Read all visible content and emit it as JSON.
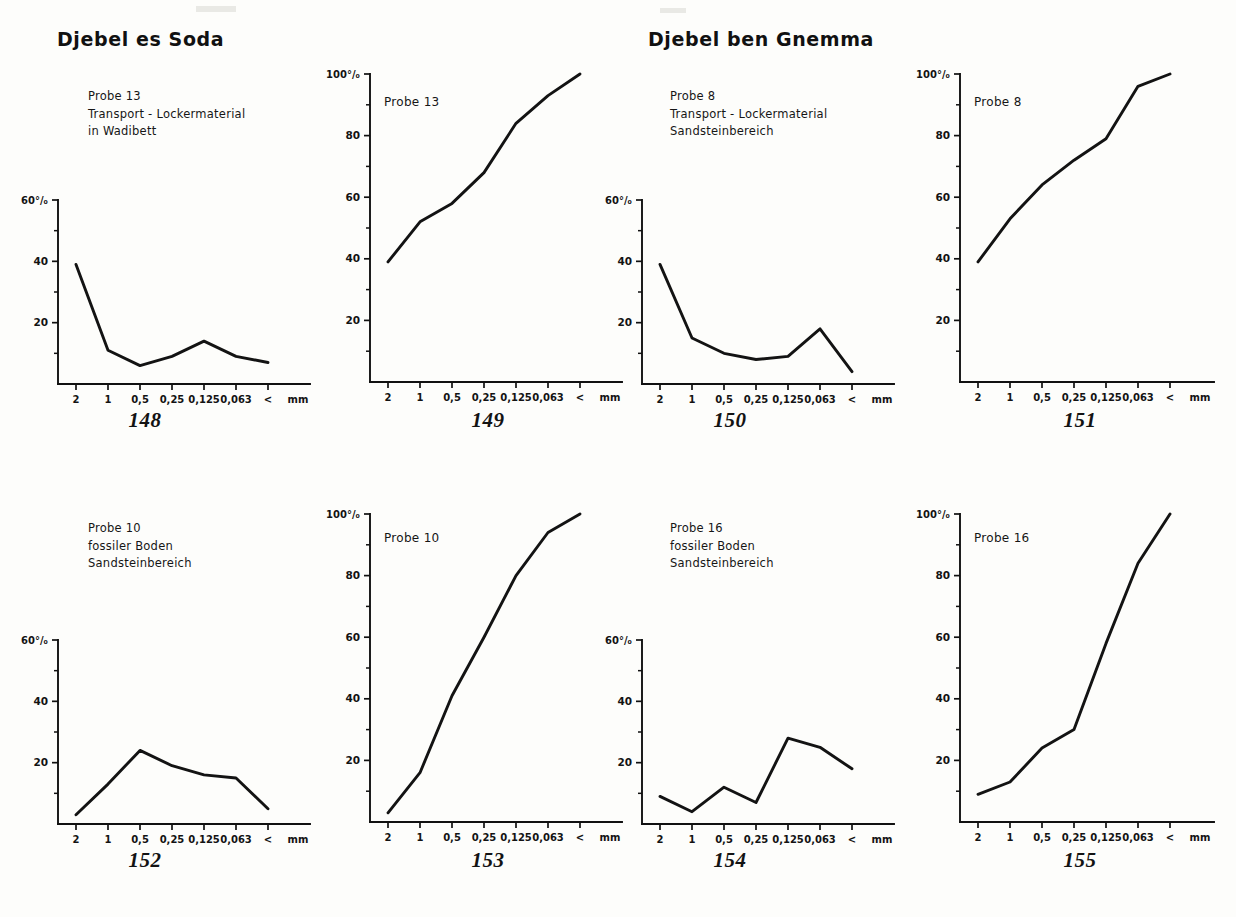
{
  "locations": [
    {
      "name": "Djebel es Soda"
    },
    {
      "name": "Djebel ben Gnemma"
    }
  ],
  "axis": {
    "x_categories": [
      "2",
      "1",
      "0,5",
      "0,25",
      "0,125",
      "0,063",
      "<"
    ],
    "x_unit": "mm",
    "y_small_labels": [
      "60%",
      "40",
      "20"
    ],
    "y_large_labels": [
      "100%",
      "80",
      "60",
      "40",
      "20"
    ],
    "y_small_top_text": "60°/₀",
    "y_large_top_text": "100°/₀"
  },
  "charts": [
    {
      "figure": "148",
      "probe": "Probe 13",
      "desc_line2": "Transport - Lockermaterial",
      "desc_line3": "in Wadibett",
      "kind": "histogram"
    },
    {
      "figure": "149",
      "probe": "Probe 13",
      "kind": "cumulative"
    },
    {
      "figure": "150",
      "probe": "Probe 8",
      "desc_line2": "Transport - Lockermaterial",
      "desc_line3": "Sandsteinbereich",
      "kind": "histogram"
    },
    {
      "figure": "151",
      "probe": "Probe 8",
      "kind": "cumulative"
    },
    {
      "figure": "152",
      "probe": "Probe 10",
      "desc_line2": "fossiler Boden",
      "desc_line3": "Sandsteinbereich",
      "kind": "histogram"
    },
    {
      "figure": "153",
      "probe": "Probe 10",
      "kind": "cumulative"
    },
    {
      "figure": "154",
      "probe": "Probe 16",
      "desc_line2": "fossiler Boden",
      "desc_line3": "Sandsteinbereich",
      "kind": "histogram"
    },
    {
      "figure": "155",
      "probe": "Probe 16",
      "kind": "cumulative"
    }
  ],
  "chart_data": [
    {
      "type": "line",
      "title": "148",
      "subtitle": "Probe 13 — Transport - Lockermaterial, in Wadibett",
      "xlabel": "mm",
      "ylabel": "%",
      "categories": [
        "2",
        "1",
        "0,5",
        "0,25",
        "0,125",
        "0,063",
        "<"
      ],
      "values": [
        39,
        11,
        6,
        9,
        14,
        9,
        7
      ],
      "ylim": [
        0,
        60
      ],
      "yticks": [
        0,
        20,
        40,
        60
      ],
      "grid": false,
      "legend": "none"
    },
    {
      "type": "line",
      "title": "149",
      "subtitle": "Probe 13 — cumulative",
      "xlabel": "mm",
      "ylabel": "%",
      "categories": [
        "2",
        "1",
        "0,5",
        "0,25",
        "0,125",
        "0,063",
        "<"
      ],
      "values": [
        39,
        52,
        58,
        68,
        84,
        93,
        100
      ],
      "ylim": [
        0,
        100
      ],
      "yticks": [
        0,
        20,
        40,
        60,
        80,
        100
      ],
      "grid": false,
      "legend": "none"
    },
    {
      "type": "line",
      "title": "150",
      "subtitle": "Probe 8 — Transport - Lockermaterial, Sandsteinbereich",
      "xlabel": "mm",
      "ylabel": "%",
      "categories": [
        "2",
        "1",
        "0,5",
        "0,25",
        "0,125",
        "0,063",
        "<"
      ],
      "values": [
        39,
        15,
        10,
        8,
        9,
        18,
        4
      ],
      "ylim": [
        0,
        60
      ],
      "yticks": [
        0,
        20,
        40,
        60
      ],
      "grid": false,
      "legend": "none"
    },
    {
      "type": "line",
      "title": "151",
      "subtitle": "Probe 8 — cumulative",
      "xlabel": "mm",
      "ylabel": "%",
      "categories": [
        "2",
        "1",
        "0,5",
        "0,25",
        "0,125",
        "0,063",
        "<"
      ],
      "values": [
        39,
        53,
        64,
        72,
        79,
        96,
        100
      ],
      "ylim": [
        0,
        100
      ],
      "yticks": [
        0,
        20,
        40,
        60,
        80,
        100
      ],
      "grid": false,
      "legend": "none"
    },
    {
      "type": "line",
      "title": "152",
      "subtitle": "Probe 10 — fossiler Boden, Sandsteinbereich",
      "xlabel": "mm",
      "ylabel": "%",
      "categories": [
        "2",
        "1",
        "0,5",
        "0,25",
        "0,125",
        "0,063",
        "<"
      ],
      "values": [
        3,
        13,
        24,
        19,
        16,
        15,
        5
      ],
      "ylim": [
        0,
        60
      ],
      "yticks": [
        0,
        20,
        40,
        60
      ],
      "grid": false,
      "legend": "none"
    },
    {
      "type": "line",
      "title": "153",
      "subtitle": "Probe 10 — cumulative",
      "xlabel": "mm",
      "ylabel": "%",
      "categories": [
        "2",
        "1",
        "0,5",
        "0,25",
        "0,125",
        "0,063",
        "<"
      ],
      "values": [
        3,
        16,
        41,
        60,
        80,
        94,
        100
      ],
      "ylim": [
        0,
        100
      ],
      "yticks": [
        0,
        20,
        40,
        60,
        80,
        100
      ],
      "grid": false,
      "legend": "none"
    },
    {
      "type": "line",
      "title": "154",
      "subtitle": "Probe 16 — fossiler Boden, Sandsteinbereich",
      "xlabel": "mm",
      "ylabel": "%",
      "categories": [
        "2",
        "1",
        "0,5",
        "0,25",
        "0,125",
        "0,063",
        "<"
      ],
      "values": [
        9,
        4,
        12,
        7,
        28,
        25,
        18
      ],
      "ylim": [
        0,
        60
      ],
      "yticks": [
        0,
        20,
        40,
        60
      ],
      "grid": false,
      "legend": "none"
    },
    {
      "type": "line",
      "title": "155",
      "subtitle": "Probe 16 — cumulative",
      "xlabel": "mm",
      "ylabel": "%",
      "categories": [
        "2",
        "1",
        "0,5",
        "0,25",
        "0,125",
        "0,063",
        "<"
      ],
      "values": [
        9,
        13,
        24,
        30,
        58,
        84,
        100
      ],
      "ylim": [
        0,
        100
      ],
      "yticks": [
        0,
        20,
        40,
        60,
        80,
        100
      ],
      "grid": false,
      "legend": "none"
    }
  ],
  "colors": {
    "ink": "#131313",
    "paper": "#fdfdfb"
  }
}
